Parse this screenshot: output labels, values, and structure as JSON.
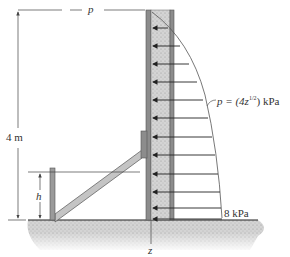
{
  "figure": {
    "labels": {
      "top_dimension": "p",
      "height_dimension": "4 m",
      "brace_height": "h",
      "pressure_formula_prefix": "p = (4z",
      "pressure_formula_exponent": "1/2",
      "pressure_formula_suffix": ") kPa",
      "base_pressure": "8 kPa",
      "axis": "z"
    },
    "colors": {
      "wall_plate": "#8c8c8c",
      "wall_core": "#cfcfcf",
      "ground": "#d6d6d6",
      "brace": "#c4c4c4",
      "lines": "#333333"
    },
    "pressure": {
      "wall_height_m": 4,
      "max_kPa": 8,
      "law": "p = 4 z^(1/2)",
      "arrow_count": 12
    }
  }
}
